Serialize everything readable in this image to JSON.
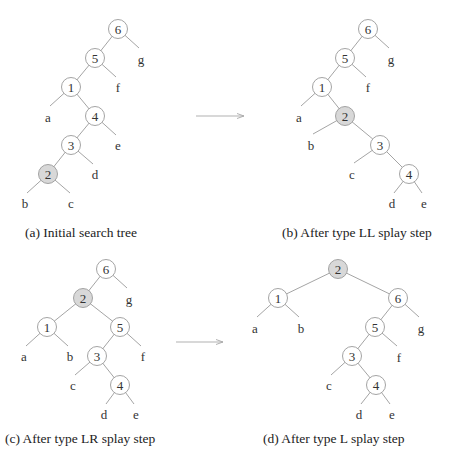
{
  "figure": {
    "panels": [
      {
        "id": "a",
        "caption": "(a) Initial search tree",
        "caption_pos": [
          25,
          237
        ],
        "nodes": [
          {
            "label": "6",
            "x": 118,
            "y": 29,
            "highlight": false
          },
          {
            "label": "5",
            "x": 95,
            "y": 58,
            "highlight": false
          },
          {
            "label": "1",
            "x": 71,
            "y": 87,
            "highlight": false
          },
          {
            "label": "4",
            "x": 95,
            "y": 116,
            "highlight": false
          },
          {
            "label": "3",
            "x": 71,
            "y": 145,
            "highlight": false
          },
          {
            "label": "2",
            "x": 48,
            "y": 174,
            "highlight": true
          }
        ],
        "leaves": [
          {
            "label": "g",
            "x": 141,
            "y": 59
          },
          {
            "label": "f",
            "x": 118,
            "y": 87
          },
          {
            "label": "a",
            "x": 48,
            "y": 117
          },
          {
            "label": "e",
            "x": 118,
            "y": 145
          },
          {
            "label": "d",
            "x": 95,
            "y": 174
          },
          {
            "label": "b",
            "x": 25,
            "y": 203
          },
          {
            "label": "c",
            "x": 71,
            "y": 203
          }
        ],
        "edges": [
          [
            118,
            29,
            95,
            58
          ],
          [
            118,
            29,
            139,
            48
          ],
          [
            95,
            58,
            71,
            87
          ],
          [
            95,
            58,
            116,
            77
          ],
          [
            71,
            87,
            50,
            106
          ],
          [
            71,
            87,
            95,
            116
          ],
          [
            95,
            116,
            71,
            145
          ],
          [
            95,
            116,
            116,
            135
          ],
          [
            71,
            145,
            48,
            174
          ],
          [
            71,
            145,
            93,
            164
          ],
          [
            48,
            174,
            27,
            193
          ],
          [
            48,
            174,
            70,
            193
          ]
        ]
      },
      {
        "id": "b",
        "caption": "(b) After type LL splay step",
        "caption_pos": [
          282,
          237
        ],
        "nodes": [
          {
            "label": "6",
            "x": 368,
            "y": 29,
            "highlight": false
          },
          {
            "label": "5",
            "x": 345,
            "y": 58,
            "highlight": false
          },
          {
            "label": "1",
            "x": 322,
            "y": 87,
            "highlight": false
          },
          {
            "label": "2",
            "x": 345,
            "y": 116,
            "highlight": true
          },
          {
            "label": "3",
            "x": 380,
            "y": 145,
            "highlight": false
          },
          {
            "label": "4",
            "x": 409,
            "y": 174,
            "highlight": false
          }
        ],
        "leaves": [
          {
            "label": "g",
            "x": 391,
            "y": 59
          },
          {
            "label": "f",
            "x": 368,
            "y": 87
          },
          {
            "label": "a",
            "x": 299,
            "y": 117
          },
          {
            "label": "b",
            "x": 311,
            "y": 145
          },
          {
            "label": "c",
            "x": 352,
            "y": 174
          },
          {
            "label": "d",
            "x": 392,
            "y": 203
          },
          {
            "label": "e",
            "x": 424,
            "y": 203
          }
        ],
        "edges": [
          [
            368,
            29,
            345,
            58
          ],
          [
            368,
            29,
            389,
            48
          ],
          [
            345,
            58,
            322,
            87
          ],
          [
            345,
            58,
            366,
            77
          ],
          [
            322,
            87,
            301,
            106
          ],
          [
            322,
            87,
            345,
            116
          ],
          [
            345,
            116,
            313,
            134
          ],
          [
            345,
            116,
            380,
            145
          ],
          [
            380,
            145,
            354,
            163
          ],
          [
            380,
            145,
            409,
            174
          ],
          [
            409,
            174,
            394,
            193
          ],
          [
            409,
            174,
            422,
            193
          ]
        ]
      },
      {
        "id": "c",
        "caption": "(c) After type LR splay step",
        "caption_pos": [
          5,
          443
        ],
        "nodes": [
          {
            "label": "6",
            "x": 106,
            "y": 269,
            "highlight": false
          },
          {
            "label": "2",
            "x": 83,
            "y": 298,
            "highlight": true
          },
          {
            "label": "1",
            "x": 47,
            "y": 327,
            "highlight": false
          },
          {
            "label": "5",
            "x": 120,
            "y": 327,
            "highlight": false
          },
          {
            "label": "3",
            "x": 97,
            "y": 356,
            "highlight": false
          },
          {
            "label": "4",
            "x": 120,
            "y": 385,
            "highlight": false
          }
        ],
        "leaves": [
          {
            "label": "g",
            "x": 129,
            "y": 299
          },
          {
            "label": "a",
            "x": 24,
            "y": 356
          },
          {
            "label": "b",
            "x": 70,
            "y": 356
          },
          {
            "label": "f",
            "x": 143,
            "y": 356
          },
          {
            "label": "c",
            "x": 73,
            "y": 385
          },
          {
            "label": "d",
            "x": 104,
            "y": 414
          },
          {
            "label": "e",
            "x": 136,
            "y": 414
          }
        ],
        "edges": [
          [
            106,
            269,
            83,
            298
          ],
          [
            106,
            269,
            127,
            288
          ],
          [
            83,
            298,
            47,
            327
          ],
          [
            83,
            298,
            120,
            327
          ],
          [
            47,
            327,
            26,
            346
          ],
          [
            47,
            327,
            68,
            346
          ],
          [
            120,
            327,
            97,
            356
          ],
          [
            120,
            327,
            141,
            346
          ],
          [
            97,
            356,
            75,
            375
          ],
          [
            97,
            356,
            120,
            385
          ],
          [
            120,
            385,
            106,
            404
          ],
          [
            120,
            385,
            134,
            404
          ]
        ]
      },
      {
        "id": "d",
        "caption": "(d) After type L splay step",
        "caption_pos": [
          263,
          443
        ],
        "nodes": [
          {
            "label": "2",
            "x": 338,
            "y": 269,
            "highlight": true
          },
          {
            "label": "1",
            "x": 278,
            "y": 298,
            "highlight": false
          },
          {
            "label": "6",
            "x": 398,
            "y": 298,
            "highlight": false
          },
          {
            "label": "5",
            "x": 375,
            "y": 327,
            "highlight": false
          },
          {
            "label": "3",
            "x": 352,
            "y": 356,
            "highlight": false
          },
          {
            "label": "4",
            "x": 376,
            "y": 385,
            "highlight": false
          }
        ],
        "leaves": [
          {
            "label": "a",
            "x": 255,
            "y": 328
          },
          {
            "label": "b",
            "x": 301,
            "y": 328
          },
          {
            "label": "g",
            "x": 421,
            "y": 328
          },
          {
            "label": "f",
            "x": 399,
            "y": 357
          },
          {
            "label": "c",
            "x": 329,
            "y": 385
          },
          {
            "label": "d",
            "x": 359,
            "y": 414
          },
          {
            "label": "e",
            "x": 392,
            "y": 414
          }
        ],
        "edges": [
          [
            338,
            269,
            278,
            298
          ],
          [
            338,
            269,
            398,
            298
          ],
          [
            278,
            298,
            257,
            317
          ],
          [
            278,
            298,
            299,
            317
          ],
          [
            398,
            298,
            375,
            327
          ],
          [
            398,
            298,
            419,
            317
          ],
          [
            375,
            327,
            352,
            356
          ],
          [
            375,
            327,
            397,
            346
          ],
          [
            352,
            356,
            331,
            375
          ],
          [
            352,
            356,
            376,
            385
          ],
          [
            376,
            385,
            361,
            404
          ],
          [
            376,
            385,
            390,
            404
          ]
        ]
      }
    ],
    "arrows": [
      {
        "name": "arrow-a-to-b",
        "x1": 196,
        "y1": 116,
        "x2": 244,
        "y2": 116
      },
      {
        "name": "arrow-c-to-d",
        "x1": 176,
        "y1": 342,
        "x2": 223,
        "y2": 342
      }
    ],
    "style": {
      "node_radius": 9.5,
      "highlight_fill": "#d8d8d8",
      "stroke": "#9a9a9a"
    }
  }
}
